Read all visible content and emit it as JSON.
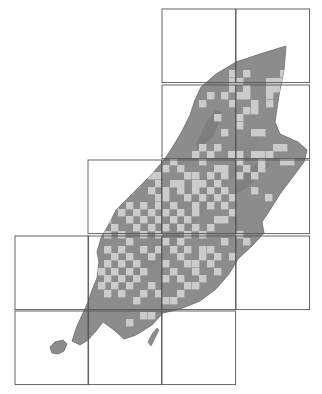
{
  "map": {
    "subject": "Isle of Man distribution map",
    "colors": {
      "background": "#ffffff",
      "land": "#8c8c8c",
      "land_shadow": "#6e6e6e",
      "land_highlight": "#a9a9a9",
      "record_square": "#cbcbcb",
      "grid_line": "#555555"
    },
    "grid": {
      "cell_px": 73.6,
      "squares_10km": [
        {
          "x": 162,
          "y": 9
        },
        {
          "x": 236,
          "y": 9
        },
        {
          "x": 162,
          "y": 85
        },
        {
          "x": 236,
          "y": 85
        },
        {
          "x": 88,
          "y": 160
        },
        {
          "x": 162,
          "y": 160
        },
        {
          "x": 236,
          "y": 160
        },
        {
          "x": 15,
          "y": 236
        },
        {
          "x": 88,
          "y": 236
        },
        {
          "x": 162,
          "y": 236
        },
        {
          "x": 236,
          "y": 236
        },
        {
          "x": 15,
          "y": 311
        },
        {
          "x": 88,
          "y": 311
        },
        {
          "x": 162,
          "y": 311
        }
      ]
    },
    "record_cell_px": 7.4,
    "records": [
      [
        229,
        70
      ],
      [
        243,
        70
      ],
      [
        280,
        70
      ],
      [
        229,
        78
      ],
      [
        236,
        78
      ],
      [
        266,
        78
      ],
      [
        273,
        78
      ],
      [
        280,
        78
      ],
      [
        229,
        85
      ],
      [
        243,
        85
      ],
      [
        266,
        85
      ],
      [
        273,
        85
      ],
      [
        207,
        92
      ],
      [
        221,
        92
      ],
      [
        236,
        92
      ],
      [
        243,
        92
      ],
      [
        266,
        92
      ],
      [
        199,
        100
      ],
      [
        229,
        100
      ],
      [
        251,
        100
      ],
      [
        266,
        100
      ],
      [
        243,
        107
      ],
      [
        251,
        107
      ],
      [
        214,
        114
      ],
      [
        236,
        114
      ],
      [
        236,
        122
      ],
      [
        258,
        129
      ],
      [
        221,
        129
      ],
      [
        251,
        129
      ],
      [
        199,
        144
      ],
      [
        214,
        144
      ],
      [
        273,
        144
      ],
      [
        280,
        144
      ],
      [
        192,
        151
      ],
      [
        207,
        151
      ],
      [
        228,
        151
      ],
      [
        236,
        151
      ],
      [
        251,
        151
      ],
      [
        258,
        151
      ],
      [
        266,
        151
      ],
      [
        170,
        158
      ],
      [
        199,
        158
      ],
      [
        236,
        158
      ],
      [
        258,
        158
      ],
      [
        280,
        158
      ],
      [
        287,
        158
      ],
      [
        162,
        165
      ],
      [
        177,
        165
      ],
      [
        214,
        165
      ],
      [
        221,
        165
      ],
      [
        243,
        165
      ],
      [
        258,
        165
      ],
      [
        148,
        172
      ],
      [
        155,
        172
      ],
      [
        184,
        172
      ],
      [
        192,
        172
      ],
      [
        207,
        172
      ],
      [
        221,
        172
      ],
      [
        236,
        172
      ],
      [
        251,
        172
      ],
      [
        133,
        180
      ],
      [
        155,
        180
      ],
      [
        170,
        180
      ],
      [
        177,
        180
      ],
      [
        192,
        180
      ],
      [
        199,
        180
      ],
      [
        214,
        180
      ],
      [
        126,
        187
      ],
      [
        148,
        187
      ],
      [
        162,
        187
      ],
      [
        177,
        187
      ],
      [
        192,
        187
      ],
      [
        207,
        187
      ],
      [
        221,
        187
      ],
      [
        251,
        187
      ],
      [
        118,
        194
      ],
      [
        155,
        194
      ],
      [
        162,
        194
      ],
      [
        184,
        194
      ],
      [
        199,
        194
      ],
      [
        214,
        194
      ],
      [
        229,
        194
      ],
      [
        265,
        194
      ],
      [
        111,
        202
      ],
      [
        126,
        202
      ],
      [
        140,
        202
      ],
      [
        155,
        202
      ],
      [
        170,
        202
      ],
      [
        192,
        202
      ],
      [
        207,
        202
      ],
      [
        221,
        202
      ],
      [
        118,
        209
      ],
      [
        133,
        209
      ],
      [
        148,
        209
      ],
      [
        162,
        209
      ],
      [
        177,
        209
      ],
      [
        192,
        209
      ],
      [
        229,
        209
      ],
      [
        104,
        216
      ],
      [
        126,
        216
      ],
      [
        140,
        216
      ],
      [
        155,
        216
      ],
      [
        170,
        216
      ],
      [
        184,
        216
      ],
      [
        214,
        216
      ],
      [
        221,
        216
      ],
      [
        111,
        224
      ],
      [
        133,
        224
      ],
      [
        148,
        224
      ],
      [
        162,
        224
      ],
      [
        177,
        224
      ],
      [
        192,
        224
      ],
      [
        207,
        224
      ],
      [
        104,
        231
      ],
      [
        118,
        231
      ],
      [
        140,
        231
      ],
      [
        155,
        231
      ],
      [
        184,
        231
      ],
      [
        199,
        231
      ],
      [
        236,
        231
      ],
      [
        126,
        238
      ],
      [
        162,
        238
      ],
      [
        177,
        238
      ],
      [
        221,
        238
      ],
      [
        243,
        238
      ],
      [
        104,
        246
      ],
      [
        118,
        246
      ],
      [
        140,
        246
      ],
      [
        155,
        246
      ],
      [
        170,
        246
      ],
      [
        184,
        246
      ],
      [
        199,
        246
      ],
      [
        207,
        246
      ],
      [
        111,
        253
      ],
      [
        126,
        253
      ],
      [
        148,
        253
      ],
      [
        177,
        253
      ],
      [
        199,
        253
      ],
      [
        214,
        253
      ],
      [
        229,
        253
      ],
      [
        104,
        260
      ],
      [
        118,
        260
      ],
      [
        133,
        260
      ],
      [
        162,
        260
      ],
      [
        184,
        260
      ],
      [
        192,
        260
      ],
      [
        207,
        260
      ],
      [
        98,
        268
      ],
      [
        111,
        268
      ],
      [
        126,
        268
      ],
      [
        140,
        268
      ],
      [
        170,
        268
      ],
      [
        192,
        268
      ],
      [
        214,
        268
      ],
      [
        104,
        275
      ],
      [
        118,
        275
      ],
      [
        133,
        275
      ],
      [
        162,
        275
      ],
      [
        177,
        275
      ],
      [
        199,
        275
      ],
      [
        98,
        282
      ],
      [
        111,
        282
      ],
      [
        126,
        282
      ],
      [
        148,
        282
      ],
      [
        184,
        282
      ],
      [
        192,
        282
      ],
      [
        104,
        290
      ],
      [
        118,
        290
      ],
      [
        140,
        290
      ],
      [
        155,
        290
      ],
      [
        177,
        290
      ],
      [
        133,
        297
      ],
      [
        162,
        297
      ],
      [
        170,
        297
      ],
      [
        140,
        312
      ],
      [
        148,
        312
      ],
      [
        126,
        319
      ]
    ]
  }
}
